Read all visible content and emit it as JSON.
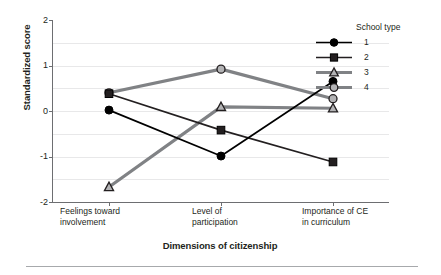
{
  "chart_data": {
    "type": "line",
    "title": "",
    "xlabel": "Dimensions of citizenship",
    "ylabel": "Standardized score",
    "categories": [
      "Feelings toward involvement",
      "Level of participation",
      "Importance of CE in curriculum"
    ],
    "category_lines": [
      [
        "Feelings toward",
        "involvement"
      ],
      [
        "Level of",
        "participation"
      ],
      [
        "Importance of CE",
        "in curriculum"
      ]
    ],
    "ylim": [
      -2,
      2
    ],
    "yticks": [
      2,
      1,
      0,
      -1,
      -2
    ],
    "ytick_labels": [
      "2",
      "1",
      "0",
      "-1",
      "-2"
    ],
    "minor_gridlines": [
      1.5,
      0.5,
      -0.5,
      -1.5
    ],
    "grid": true,
    "legend_position": "top-right",
    "legend_title": "School type",
    "series": [
      {
        "name": "1",
        "marker": "filled-circle",
        "color": "#000000",
        "values": [
          0.02,
          -0.99,
          0.65
        ]
      },
      {
        "name": "2",
        "marker": "filled-square",
        "color": "#231f20",
        "values": [
          0.38,
          -0.42,
          -1.12
        ]
      },
      {
        "name": "3",
        "marker": "open-triangle",
        "color": "#808285",
        "values": [
          -1.67,
          0.09,
          0.06
        ]
      },
      {
        "name": "4",
        "marker": "open-circle",
        "color": "#808285",
        "values": [
          0.4,
          0.92,
          0.27
        ]
      }
    ]
  }
}
